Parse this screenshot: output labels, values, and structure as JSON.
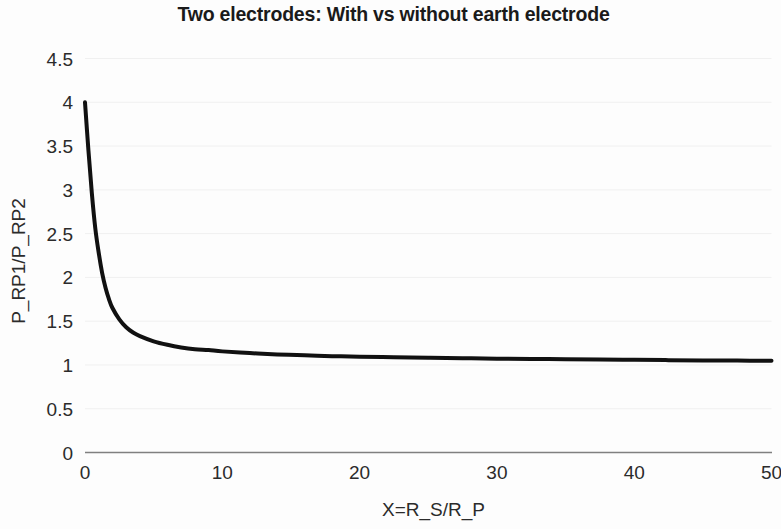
{
  "chart_data": {
    "type": "line",
    "title": "Two electrodes: With vs without earth electrode",
    "xlabel": "X=R_S/R_P",
    "ylabel": "P_RP1/P_RP2",
    "xlim": [
      0,
      50
    ],
    "ylim": [
      0,
      4.5
    ],
    "x_ticks": [
      "0",
      "10",
      "20",
      "30",
      "40",
      "50"
    ],
    "x_tick_values": [
      0,
      10,
      20,
      30,
      40,
      50
    ],
    "y_ticks": [
      "0",
      "0.5",
      "1",
      "1.5",
      "2",
      "2.5",
      "3",
      "3.5",
      "4",
      "4.5"
    ],
    "y_tick_values": [
      0,
      0.5,
      1,
      1.5,
      2,
      2.5,
      3,
      3.5,
      4,
      4.5
    ],
    "grid": true,
    "grid_axis": "y",
    "legend": null,
    "line_color": "#111111",
    "line_width": 4,
    "series": [
      {
        "name": "P_RP1/P_RP2",
        "x": [
          0,
          0.25,
          0.5,
          0.75,
          1,
          1.25,
          1.5,
          1.75,
          2,
          2.5,
          3,
          3.5,
          4,
          5,
          6,
          7,
          8,
          9,
          10,
          12,
          14,
          16,
          18,
          20,
          22.5,
          25,
          27.5,
          30,
          32.5,
          35,
          37.5,
          40,
          42.5,
          45,
          47.5,
          50
        ],
        "y": [
          4.0,
          3.45,
          2.96,
          2.56,
          2.28,
          2.05,
          1.88,
          1.75,
          1.65,
          1.52,
          1.43,
          1.37,
          1.33,
          1.27,
          1.23,
          1.2,
          1.18,
          1.17,
          1.155,
          1.135,
          1.12,
          1.11,
          1.1,
          1.095,
          1.088,
          1.082,
          1.077,
          1.072,
          1.068,
          1.065,
          1.061,
          1.058,
          1.055,
          1.052,
          1.05,
          1.047
        ]
      }
    ]
  },
  "axes": {
    "axis_line_color": "#808080",
    "grid_color": "#f0f0f0"
  }
}
